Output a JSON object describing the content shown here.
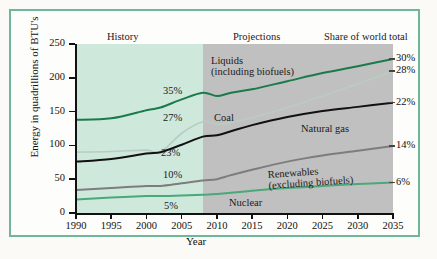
{
  "figure": {
    "band_history": "History",
    "band_projections": "Projections",
    "share_header": "Share of world total",
    "xlabel": "Year",
    "ylabel": "Energy in quadrillions of BTU's"
  },
  "chart_data": {
    "type": "line",
    "title": "",
    "xlabel": "Year",
    "ylabel": "Energy in quadrillions of BTU's",
    "xlim": [
      1990,
      2035
    ],
    "ylim": [
      0,
      250
    ],
    "yticks": [
      0,
      50,
      100,
      150,
      200,
      250
    ],
    "xticks": [
      1990,
      1995,
      2000,
      2005,
      2010,
      2015,
      2020,
      2025,
      2030,
      2035
    ],
    "grid": false,
    "legend": "inline-annotations",
    "history_projection_split": 2008,
    "band_colors": {
      "history": "#cfe8dc",
      "projections": "#c0c0c0"
    },
    "right_axis_labels": [
      {
        "text": "30%",
        "value": 228
      },
      {
        "text": "28%",
        "value": 210
      },
      {
        "text": "22%",
        "value": 163
      },
      {
        "text": "14%",
        "value": 99
      },
      {
        "text": "6%",
        "value": 45
      }
    ],
    "x": [
      1990,
      1995,
      2000,
      2002,
      2005,
      2008,
      2010,
      2012,
      2015,
      2020,
      2025,
      2030,
      2035
    ],
    "series": [
      {
        "name": "Liquids (including biofuels)",
        "color": "#1a7a4a",
        "share_label": "35%",
        "share_label_year": 2005,
        "end_share": "30%",
        "values": [
          138,
          140,
          152,
          156,
          168,
          178,
          173,
          178,
          183,
          195,
          207,
          217,
          228
        ]
      },
      {
        "name": "Coal",
        "color": "#b9ccc2",
        "share_label": "27%",
        "share_label_year": 2005,
        "end_share": "28%",
        "values": [
          90,
          91,
          93,
          90,
          118,
          135,
          131,
          134,
          141,
          156,
          173,
          191,
          210
        ]
      },
      {
        "name": "Natural gas",
        "color": "#111111",
        "share_label": "23%",
        "share_label_year": 2005,
        "end_share": "22%",
        "values": [
          76,
          80,
          88,
          90,
          101,
          113,
          115,
          121,
          130,
          142,
          151,
          157,
          163
        ]
      },
      {
        "name": "Renewables (excluding biofuels)",
        "color": "#7d7d7d",
        "share_label": "10%",
        "share_label_year": 2005,
        "end_share": "14%",
        "values": [
          34,
          37,
          40,
          40,
          44,
          48,
          50,
          56,
          64,
          76,
          85,
          92,
          99
        ]
      },
      {
        "name": "Nuclear",
        "color": "#4aa87a",
        "share_label": "5%",
        "share_label_year": 2005,
        "end_share": "6%",
        "values": [
          20,
          23,
          25,
          25,
          26,
          27,
          28,
          30,
          33,
          37,
          40,
          43,
          45
        ]
      }
    ]
  }
}
